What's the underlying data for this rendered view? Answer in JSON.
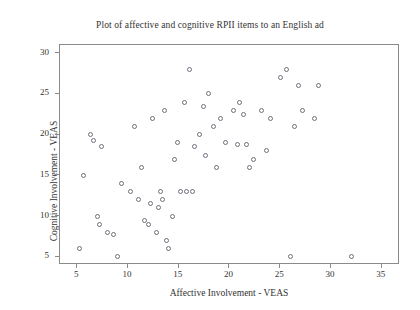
{
  "chart_data": {
    "type": "scatter",
    "title": "Plot of affective and cognitive RPII items to an English ad\nfor jeans by Danish speakers",
    "title_line1": "Plot of affective and cognitive RPII items to an English ad",
    "title_line2": "for jeans by Danish speakers",
    "xlabel": "Affective Involvement - VEAS",
    "ylabel": "Cognitive Involvement - VEAS",
    "xlim": [
      3.3,
      36.8
    ],
    "ylim": [
      4.0,
      31.0
    ],
    "xticks": [
      5,
      10,
      15,
      20,
      25,
      30,
      35
    ],
    "yticks": [
      5,
      10,
      15,
      20,
      25,
      30
    ],
    "grid": false,
    "legend": null,
    "marker": "open-circle",
    "marker_color": "#6f6f7a",
    "frame_color": "#8a8a8a",
    "background": "#ffffff",
    "n_points": 62,
    "points": [
      [
        5.2,
        6.0
      ],
      [
        5.6,
        15.0
      ],
      [
        6.3,
        20.0
      ],
      [
        6.6,
        19.3
      ],
      [
        7.4,
        18.5
      ],
      [
        7.0,
        10.0
      ],
      [
        7.2,
        9.0
      ],
      [
        8.0,
        8.0
      ],
      [
        8.6,
        7.7
      ],
      [
        9.0,
        5.0
      ],
      [
        9.4,
        14.0
      ],
      [
        10.2,
        13.0
      ],
      [
        10.6,
        21.0
      ],
      [
        11.0,
        12.0
      ],
      [
        11.3,
        16.0
      ],
      [
        11.6,
        9.5
      ],
      [
        12.0,
        9.0
      ],
      [
        12.2,
        11.5
      ],
      [
        12.4,
        22.0
      ],
      [
        12.8,
        8.0
      ],
      [
        13.0,
        11.0
      ],
      [
        13.2,
        13.0
      ],
      [
        13.4,
        12.0
      ],
      [
        13.6,
        23.0
      ],
      [
        13.8,
        7.0
      ],
      [
        14.0,
        6.0
      ],
      [
        14.4,
        10.0
      ],
      [
        14.6,
        17.0
      ],
      [
        14.9,
        19.0
      ],
      [
        15.2,
        13.0
      ],
      [
        15.6,
        24.0
      ],
      [
        15.8,
        13.0
      ],
      [
        16.1,
        28.0
      ],
      [
        16.4,
        13.0
      ],
      [
        16.6,
        18.5
      ],
      [
        17.0,
        20.0
      ],
      [
        17.4,
        23.5
      ],
      [
        17.6,
        17.5
      ],
      [
        17.9,
        25.0
      ],
      [
        18.4,
        21.0
      ],
      [
        18.7,
        16.0
      ],
      [
        19.1,
        22.0
      ],
      [
        19.6,
        19.0
      ],
      [
        20.4,
        23.0
      ],
      [
        20.8,
        18.8
      ],
      [
        21.0,
        24.0
      ],
      [
        21.4,
        22.5
      ],
      [
        21.7,
        18.8
      ],
      [
        22.0,
        16.0
      ],
      [
        22.4,
        17.0
      ],
      [
        23.2,
        23.0
      ],
      [
        23.6,
        18.0
      ],
      [
        24.0,
        22.0
      ],
      [
        25.0,
        27.0
      ],
      [
        25.6,
        28.0
      ],
      [
        26.0,
        5.0
      ],
      [
        26.4,
        21.0
      ],
      [
        26.8,
        26.0
      ],
      [
        27.2,
        23.0
      ],
      [
        28.4,
        22.0
      ],
      [
        28.8,
        26.0
      ],
      [
        32.0,
        5.0
      ]
    ]
  }
}
